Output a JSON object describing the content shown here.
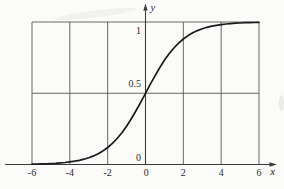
{
  "figure": {
    "background": "#fbfbf9"
  },
  "chart_data": {
    "type": "line",
    "title": "",
    "xlabel": "x",
    "ylabel": "y",
    "xlim": [
      -6,
      6
    ],
    "ylim": [
      0,
      1
    ],
    "grid": true,
    "legend": false,
    "xticks": {
      "values": [
        -6,
        -4,
        -2,
        0,
        2,
        4,
        6
      ],
      "labels": [
        "-6",
        "-4",
        "-2",
        "0",
        "2",
        "4",
        "6"
      ]
    },
    "yticks": {
      "values": [
        0,
        0.5,
        1
      ],
      "labels": [
        "0",
        "0.5",
        "1"
      ]
    },
    "series": [
      {
        "name": "logistic sigmoid y = 1/(1+e^-x)",
        "x": [
          -6,
          -5.75,
          -5.5,
          -5.25,
          -5,
          -4.75,
          -4.5,
          -4.25,
          -4,
          -3.75,
          -3.5,
          -3.25,
          -3,
          -2.75,
          -2.5,
          -2.25,
          -2,
          -1.75,
          -1.5,
          -1.25,
          -1,
          -0.75,
          -0.5,
          -0.25,
          0,
          0.25,
          0.5,
          0.75,
          1,
          1.25,
          1.5,
          1.75,
          2,
          2.25,
          2.5,
          2.75,
          3,
          3.25,
          3.5,
          3.75,
          4,
          4.25,
          4.5,
          4.75,
          5,
          5.25,
          5.5,
          5.75,
          6
        ],
        "y": [
          0.0025,
          0.0032,
          0.0041,
          0.0052,
          0.0067,
          0.0086,
          0.011,
          0.0141,
          0.018,
          0.0229,
          0.0293,
          0.0373,
          0.0474,
          0.0601,
          0.0759,
          0.0953,
          0.1192,
          0.148,
          0.1824,
          0.2227,
          0.2689,
          0.3208,
          0.3775,
          0.4378,
          0.5,
          0.5622,
          0.6225,
          0.6792,
          0.7311,
          0.7773,
          0.8176,
          0.852,
          0.8808,
          0.9047,
          0.9241,
          0.9399,
          0.9526,
          0.9627,
          0.9707,
          0.9771,
          0.982,
          0.9859,
          0.989,
          0.9914,
          0.9933,
          0.9948,
          0.9959,
          0.9968,
          0.9975
        ]
      }
    ],
    "colors": {
      "curve": "#1a1a1a",
      "grid": "#585858",
      "axis": "#3d3d3d",
      "text": "#2e2e2e"
    }
  }
}
